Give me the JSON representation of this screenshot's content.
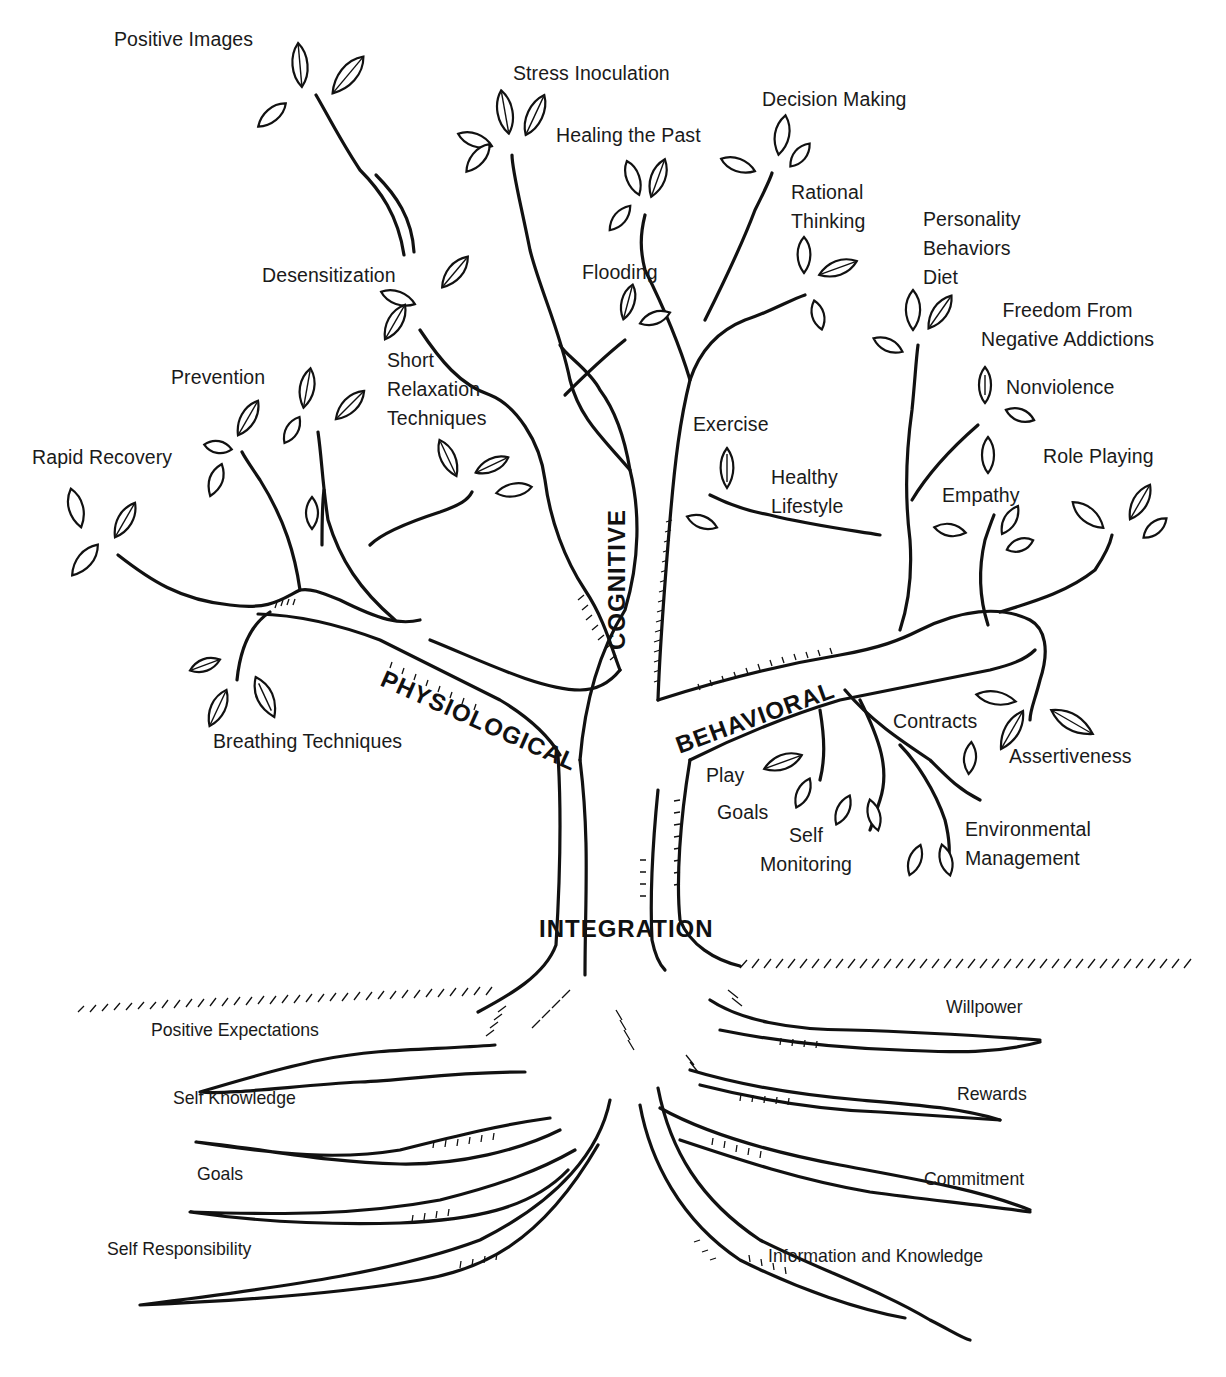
{
  "diagram": {
    "type": "tree",
    "categories": {
      "physiological": "PHYSIOLOGICAL",
      "cognitive": "COGNITIVE",
      "behavioral": "BEHAVIORAL",
      "integration": "INTEGRATION"
    },
    "branches": {
      "physiological": [
        "Rapid Recovery",
        "Prevention",
        "Short Relaxation Techniques",
        "Desensitization",
        "Positive Images",
        "Breathing Techniques"
      ],
      "cognitive": [
        "Stress Inoculation",
        "Healing the Past",
        "Flooding",
        "Decision Making",
        "Rational Thinking"
      ],
      "behavioral": [
        "Exercise",
        "Healthy Lifestyle",
        "Personality Behaviors Diet",
        "Freedom From Negative Addictions",
        "Nonviolence",
        "Empathy",
        "Role Playing",
        "Contracts",
        "Assertiveness",
        "Play",
        "Goals",
        "Self Monitoring",
        "Environmental Management"
      ]
    },
    "roots": {
      "left": [
        "Positive Expectations",
        "Self Knowledge",
        "Goals",
        "Self Responsibility"
      ],
      "right": [
        "Willpower",
        "Rewards",
        "Commitment",
        "Information and Knowledge"
      ]
    }
  },
  "labels": {
    "positive_images": "Positive Images",
    "stress_inoculation": "Stress Inoculation",
    "decision_making": "Decision Making",
    "healing_the_past": "Healing the Past",
    "rational_thinking": "Rational\nThinking",
    "personality": "Personality\nBehaviors\nDiet",
    "freedom": "Freedom From\nNegative Addictions",
    "desensitization": "Desensitization",
    "flooding": "Flooding",
    "short_relaxation": "Short\nRelaxation\nTechniques",
    "prevention": "Prevention",
    "nonviolence": "Nonviolence",
    "exercise": "Exercise",
    "rapid_recovery": "Rapid Recovery",
    "role_playing": "Role Playing",
    "healthy_lifestyle": "Healthy\nLifestyle",
    "empathy": "Empathy",
    "contracts": "Contracts",
    "breathing": "Breathing Techniques",
    "assertiveness": "Assertiveness",
    "play": "Play",
    "goals_b": "Goals",
    "self_monitoring": "Self\nMonitoring",
    "environmental": "Environmental\nManagement"
  },
  "roots": {
    "positive_expectations": "Positive Expectations",
    "self_knowledge": "Self Knowledge",
    "goals": "Goals",
    "self_responsibility": "Self Responsibility",
    "willpower": "Willpower",
    "rewards": "Rewards",
    "commitment": "Commitment",
    "information": "Information and Knowledge"
  }
}
